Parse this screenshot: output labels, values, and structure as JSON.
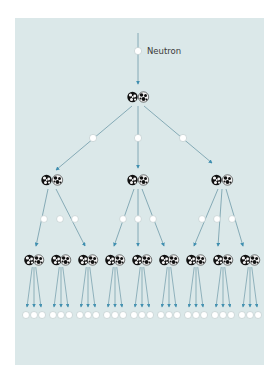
{
  "labels": {
    "neutron": "Neutron"
  },
  "colors": {
    "page_background": "#ffffff",
    "panel_background": "#dbe8e9",
    "arrow_line": "#6f9aa8",
    "arrow_head": "#3f8fb0",
    "neutron_fill": "#ffffff",
    "neutron_stroke": "#b9c6c8",
    "nucleus_dark": "#111111",
    "nucleus_light": "#f4f4f4"
  },
  "panel": {
    "x": 15,
    "y": 18,
    "width": 249,
    "height": 347
  },
  "generations": [
    {
      "level": 0,
      "description": "Incoming neutron",
      "neutrons": 1
    },
    {
      "level": 1,
      "description": "Nucleus splits",
      "nucleus_pairs": 1,
      "neutrons_released": 3
    },
    {
      "level": 2,
      "description": "Second generation fissions",
      "nucleus_pairs": 3,
      "neutrons_released": 9
    },
    {
      "level": 3,
      "description": "Third generation fissions",
      "nucleus_pairs": 9,
      "neutrons_released": 27
    }
  ],
  "layout": {
    "top_neutron": {
      "x": 138,
      "y": 51
    },
    "level1_pair": {
      "x": 138,
      "y": 97
    },
    "level2_neutrons": [
      {
        "x": 93,
        "y": 138
      },
      {
        "x": 138,
        "y": 138
      },
      {
        "x": 183,
        "y": 138
      }
    ],
    "level2_pairs": [
      {
        "x": 52,
        "y": 180
      },
      {
        "x": 138,
        "y": 180
      },
      {
        "x": 222,
        "y": 180
      }
    ],
    "level3_neutron_y": 219,
    "level3_pair_y": 260,
    "level3_pair_x": [
      34,
      61,
      88,
      115,
      142,
      169,
      196,
      223,
      250
    ],
    "bottom_neutron_y": 315
  }
}
